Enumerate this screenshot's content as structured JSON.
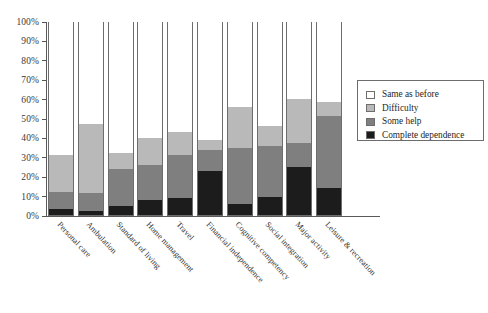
{
  "chart_data": {
    "type": "bar",
    "subtype": "stacked-percentage-column",
    "title": "",
    "xlabel": "",
    "ylabel": "",
    "ylim": [
      0,
      100
    ],
    "ytick_labels": [
      "0%",
      "10%",
      "20%",
      "30%",
      "40%",
      "50%",
      "60%",
      "70%",
      "80%",
      "90%",
      "100%"
    ],
    "ytick_values": [
      0,
      10,
      20,
      30,
      40,
      50,
      60,
      70,
      80,
      90,
      100
    ],
    "grid": false,
    "legend_position": "right",
    "categories": [
      "Personal care",
      "Ambulation",
      "Standard of living",
      "Home management",
      "Travel",
      "Financial independence",
      "Cognitive competency",
      "Social integration",
      "Major activity",
      "Leisure & recreation"
    ],
    "series": [
      {
        "name": "Complete dependence",
        "color": "#1c1c1c",
        "values": [
          3,
          2,
          4.5,
          7.5,
          9,
          22.5,
          5.5,
          9.5,
          25,
          14
        ]
      },
      {
        "name": "Some help",
        "color": "#7f7f7f",
        "values": [
          9,
          9.5,
          19,
          18.5,
          22,
          11,
          29,
          26,
          12,
          37
        ]
      },
      {
        "name": "Difficulty",
        "color": "#b9b9b9",
        "values": [
          19,
          35.5,
          8.5,
          13.5,
          12,
          5,
          21,
          10.5,
          23,
          7.5
        ]
      },
      {
        "name": "Same as before",
        "color": "#ffffff",
        "values": [
          69,
          53,
          68,
          60.5,
          57,
          61.5,
          44.5,
          54,
          40,
          41.5
        ]
      }
    ],
    "cumulative_tops": {
      "complete_dependence": [
        3,
        2,
        4.5,
        7.5,
        9,
        22.5,
        5.5,
        9.5,
        25,
        14
      ],
      "some_help": [
        12,
        11.5,
        23.5,
        26,
        31,
        33.5,
        34.5,
        35.5,
        37,
        51
      ],
      "difficulty": [
        31,
        47,
        32,
        39.5,
        43,
        38.5,
        55.5,
        46,
        60,
        58.5
      ],
      "same_as_before": [
        100,
        100,
        100,
        100,
        100,
        100,
        100,
        100,
        100,
        100
      ]
    }
  },
  "legend": {
    "items": [
      {
        "label": "Same as before",
        "color": "#ffffff"
      },
      {
        "label": "Difficulty",
        "color": "#b9b9b9"
      },
      {
        "label": "Some help",
        "color": "#7f7f7f"
      },
      {
        "label": "Complete dependence",
        "color": "#1c1c1c"
      }
    ]
  },
  "colors": {
    "same_as_before": "#ffffff",
    "difficulty": "#b9b9b9",
    "some_help": "#7f7f7f",
    "complete_dependence": "#1c1c1c",
    "axis": "#5a5a5a",
    "outline": "#6d6d6d",
    "text": "#2e2e2e",
    "background": "#ffffff"
  }
}
